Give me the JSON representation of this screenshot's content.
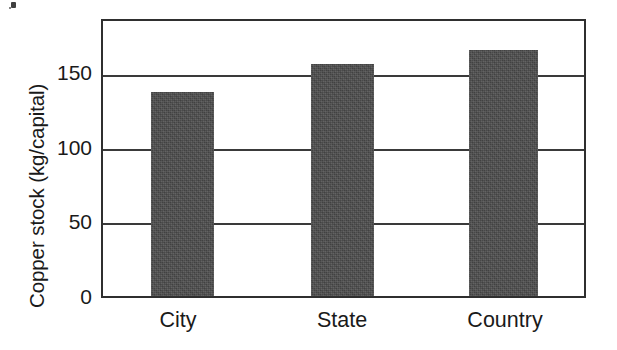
{
  "chart_data": {
    "type": "bar",
    "title": "",
    "xlabel": "",
    "ylabel": "Copper stock (kg/capital)",
    "categories": [
      "City",
      "State",
      "Country"
    ],
    "values": [
      139,
      158,
      167
    ],
    "ylim": [
      0,
      187
    ],
    "yticks": [
      0,
      50,
      100,
      150
    ],
    "ytick_labels": [
      "0",
      "50",
      "100",
      "150"
    ],
    "grid": "horizontal-gridlines-at-yticks",
    "legend": "none",
    "series": [
      {
        "name": "Copper stock",
        "values": [
          139,
          158,
          167
        ],
        "color": "#4b4b4b"
      }
    ],
    "colors": {
      "bar_fill": "#4b4b4b",
      "axis": "#2f2f2f",
      "text": "#1a1a1a",
      "background": "#ffffff"
    }
  },
  "axis": {
    "y_title": "Copper stock (kg/capital)",
    "ticks": [
      {
        "label": "150",
        "value": 150
      },
      {
        "label": "100",
        "value": 100
      },
      {
        "label": "50",
        "value": 50
      },
      {
        "label": "0",
        "value": 0
      }
    ]
  },
  "bars": [
    {
      "category": "City",
      "value": 139
    },
    {
      "category": "State",
      "value": 158
    },
    {
      "category": "Country",
      "value": 167
    }
  ]
}
